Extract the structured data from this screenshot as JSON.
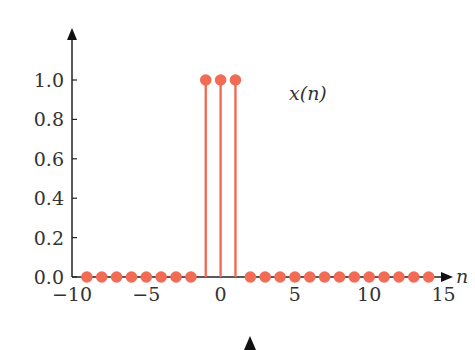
{
  "chart_data": {
    "type": "stem",
    "title": "",
    "series_label": "x(n)",
    "xlabel": "n",
    "ylabel": "",
    "xlim": [
      -10,
      15
    ],
    "ylim": [
      0,
      1.0
    ],
    "x_ticks": [
      -10,
      -5,
      0,
      5,
      10,
      15
    ],
    "x_tick_labels": [
      "−10",
      "−5",
      "0",
      "5",
      "10",
      "15"
    ],
    "y_ticks": [
      0.0,
      0.2,
      0.4,
      0.6,
      0.8,
      1.0
    ],
    "y_tick_labels": [
      "0.0",
      "0.2",
      "0.4",
      "0.6",
      "0.8",
      "1.0"
    ],
    "x": [
      -9,
      -8,
      -7,
      -6,
      -5,
      -4,
      -3,
      -2,
      -1,
      0,
      1,
      2,
      3,
      4,
      5,
      6,
      7,
      8,
      9,
      10,
      11,
      12,
      13,
      14
    ],
    "values": [
      0,
      0,
      0,
      0,
      0,
      0,
      0,
      0,
      1,
      1,
      1,
      0,
      0,
      0,
      0,
      0,
      0,
      0,
      0,
      0,
      0,
      0,
      0,
      0
    ],
    "grid": false,
    "color": "#f26b55"
  }
}
